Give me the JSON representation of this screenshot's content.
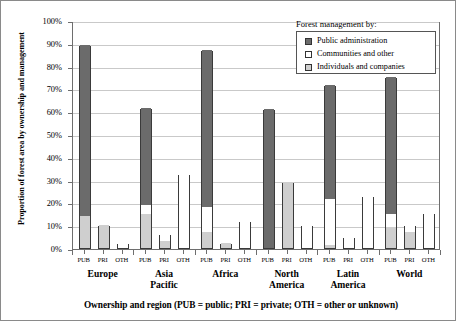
{
  "chart_data": {
    "type": "bar",
    "subtype": "grouped-stacked",
    "title": "",
    "xlabel": "Ownership and region (PUB = public; PRI = private; OTH = other or unknown)",
    "ylabel": "Proportion of forest area by ownership and management",
    "ylim": [
      0,
      100
    ],
    "ytick_labels": [
      "0%",
      "10%",
      "20%",
      "30%",
      "40%",
      "50%",
      "60%",
      "70%",
      "80%",
      "90%",
      "100%"
    ],
    "ytick_values": [
      0,
      10,
      20,
      30,
      40,
      50,
      60,
      70,
      80,
      90,
      100
    ],
    "grid": true,
    "legend_position": "top-right",
    "legend_title": "Forest management by:",
    "series": [
      {
        "name": "Public administration",
        "color": "#6b6b6b",
        "key": "public"
      },
      {
        "name": "Communities and other",
        "color": "#ffffff",
        "key": "communities"
      },
      {
        "name": "Individuals and companies",
        "color": "#cfcfcf",
        "key": "individuals"
      }
    ],
    "ownership_categories": [
      "PUB",
      "PRI",
      "OTH"
    ],
    "regions": [
      "Europe",
      "Asia Pacific",
      "Africa",
      "North America",
      "Latin America",
      "World"
    ],
    "groups": [
      {
        "region": "Europe",
        "region_line1": "Europe",
        "region_line2": "",
        "bars": [
          {
            "ownership": "PUB",
            "total": 89,
            "individuals": 14,
            "communities": 0,
            "public": 75
          },
          {
            "ownership": "PRI",
            "total": 10,
            "individuals": 10,
            "communities": 0,
            "public": 0
          },
          {
            "ownership": "OTH",
            "total": 2,
            "individuals": 0,
            "communities": 2,
            "public": 0
          }
        ]
      },
      {
        "region": "Asia Pacific",
        "region_line1": "Asia",
        "region_line2": "Pacific",
        "bars": [
          {
            "ownership": "PUB",
            "total": 61.5,
            "individuals": 15,
            "communities": 4,
            "public": 42.5
          },
          {
            "ownership": "PRI",
            "total": 6,
            "individuals": 3,
            "communities": 3,
            "public": 0
          },
          {
            "ownership": "OTH",
            "total": 32.5,
            "individuals": 0,
            "communities": 32.5,
            "public": 0
          }
        ]
      },
      {
        "region": "Africa",
        "region_line1": "Africa",
        "region_line2": "",
        "bars": [
          {
            "ownership": "PUB",
            "total": 87,
            "individuals": 7,
            "communities": 11,
            "public": 69
          },
          {
            "ownership": "PRI",
            "total": 2,
            "individuals": 2,
            "communities": 0,
            "public": 0
          },
          {
            "ownership": "OTH",
            "total": 12,
            "individuals": 0,
            "communities": 12,
            "public": 0
          }
        ]
      },
      {
        "region": "North America",
        "region_line1": "North",
        "region_line2": "America",
        "bars": [
          {
            "ownership": "PUB",
            "total": 61,
            "individuals": 0,
            "communities": 0,
            "public": 61
          },
          {
            "ownership": "PRI",
            "total": 29,
            "individuals": 29,
            "communities": 0,
            "public": 0
          },
          {
            "ownership": "OTH",
            "total": 10,
            "individuals": 0,
            "communities": 10,
            "public": 0
          }
        ]
      },
      {
        "region": "Latin America",
        "region_line1": "Latin",
        "region_line2": "America",
        "bars": [
          {
            "ownership": "PUB",
            "total": 71.5,
            "individuals": 1.5,
            "communities": 20,
            "public": 50
          },
          {
            "ownership": "PRI",
            "total": 5,
            "individuals": 0,
            "communities": 5,
            "public": 0
          },
          {
            "ownership": "OTH",
            "total": 23,
            "individuals": 0,
            "communities": 23,
            "public": 0
          }
        ]
      },
      {
        "region": "World",
        "region_line1": "World",
        "region_line2": "",
        "bars": [
          {
            "ownership": "PUB",
            "total": 75,
            "individuals": 9,
            "communities": 6,
            "public": 60
          },
          {
            "ownership": "PRI",
            "total": 10,
            "individuals": 7,
            "communities": 3,
            "public": 0
          },
          {
            "ownership": "OTH",
            "total": 15.5,
            "individuals": 0,
            "communities": 15.5,
            "public": 0
          }
        ]
      }
    ]
  }
}
